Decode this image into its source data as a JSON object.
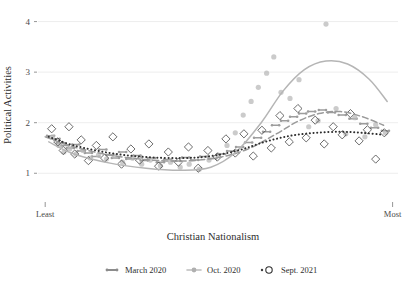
{
  "chart_data": {
    "type": "scatter",
    "title": "",
    "xlabel": "Christian Nationalism",
    "ylabel": "Political Activities",
    "xlim": [
      0,
      1
    ],
    "ylim": [
      0.55,
      4.15
    ],
    "yticks": [
      1,
      2,
      3,
      4
    ],
    "ytick_labels": [
      "1",
      "2",
      "3",
      "4"
    ],
    "xtick_labels": [
      "Least",
      "Most"
    ],
    "grid": "horizontal",
    "legend_position": "bottom-center",
    "series": [
      {
        "name": "March 2020",
        "color": "#8c8c8c",
        "marker": "dash",
        "line_style": "dashed",
        "points": [
          [
            0.035,
            1.74
          ],
          [
            0.05,
            1.68
          ],
          [
            0.062,
            1.6
          ],
          [
            0.075,
            1.55
          ],
          [
            0.09,
            1.5
          ],
          [
            0.105,
            1.57
          ],
          [
            0.12,
            1.44
          ],
          [
            0.14,
            1.4
          ],
          [
            0.16,
            1.33
          ],
          [
            0.18,
            1.47
          ],
          [
            0.2,
            1.36
          ],
          [
            0.215,
            1.3
          ],
          [
            0.235,
            1.42
          ],
          [
            0.255,
            1.28
          ],
          [
            0.275,
            1.35
          ],
          [
            0.295,
            1.25
          ],
          [
            0.315,
            1.3
          ],
          [
            0.34,
            1.22
          ],
          [
            0.36,
            1.27
          ],
          [
            0.385,
            1.24
          ],
          [
            0.41,
            1.31
          ],
          [
            0.435,
            1.26
          ],
          [
            0.46,
            1.33
          ],
          [
            0.485,
            1.29
          ],
          [
            0.51,
            1.38
          ],
          [
            0.535,
            1.44
          ],
          [
            0.56,
            1.52
          ],
          [
            0.585,
            1.61
          ],
          [
            0.61,
            1.7
          ],
          [
            0.635,
            1.82
          ],
          [
            0.66,
            1.95
          ],
          [
            0.685,
            2.04
          ],
          [
            0.71,
            2.12
          ],
          [
            0.735,
            2.18
          ],
          [
            0.76,
            2.22
          ],
          [
            0.79,
            2.25
          ],
          [
            0.815,
            2.2
          ],
          [
            0.845,
            2.15
          ],
          [
            0.875,
            2.08
          ],
          [
            0.905,
            1.98
          ],
          [
            0.935,
            1.9
          ],
          [
            0.965,
            1.84
          ]
        ],
        "fit": [
          [
            0.02,
            1.72
          ],
          [
            0.1,
            1.52
          ],
          [
            0.2,
            1.36
          ],
          [
            0.3,
            1.27
          ],
          [
            0.4,
            1.24
          ],
          [
            0.5,
            1.31
          ],
          [
            0.58,
            1.47
          ],
          [
            0.66,
            1.77
          ],
          [
            0.72,
            2.02
          ],
          [
            0.78,
            2.18
          ],
          [
            0.84,
            2.22
          ],
          [
            0.9,
            2.12
          ],
          [
            0.96,
            1.95
          ]
        ]
      },
      {
        "name": "Oct. 2020",
        "color": "#b9b9b9",
        "marker": "circle-filled",
        "line_style": "solid",
        "points": [
          [
            0.04,
            1.72
          ],
          [
            0.058,
            1.55
          ],
          [
            0.072,
            1.42
          ],
          [
            0.088,
            1.48
          ],
          [
            0.105,
            1.38
          ],
          [
            0.125,
            1.45
          ],
          [
            0.145,
            1.3
          ],
          [
            0.168,
            1.36
          ],
          [
            0.19,
            1.28
          ],
          [
            0.212,
            1.34
          ],
          [
            0.235,
            1.22
          ],
          [
            0.262,
            1.3
          ],
          [
            0.288,
            1.18
          ],
          [
            0.312,
            1.26
          ],
          [
            0.34,
            1.15
          ],
          [
            0.368,
            1.22
          ],
          [
            0.395,
            1.12
          ],
          [
            0.42,
            1.18
          ],
          [
            0.448,
            1.08
          ],
          [
            0.475,
            1.26
          ],
          [
            0.5,
            1.36
          ],
          [
            0.525,
            1.55
          ],
          [
            0.548,
            1.8
          ],
          [
            0.57,
            2.15
          ],
          [
            0.592,
            2.42
          ],
          [
            0.612,
            2.7
          ],
          [
            0.635,
            2.98
          ],
          [
            0.655,
            3.3
          ],
          [
            0.675,
            2.6
          ],
          [
            0.7,
            2.48
          ],
          [
            0.725,
            2.85
          ],
          [
            0.752,
            1.92
          ],
          [
            0.778,
            2.04
          ],
          [
            0.8,
            3.95
          ],
          [
            0.828,
            2.28
          ],
          [
            0.855,
            1.78
          ],
          [
            0.88,
            2.1
          ],
          [
            0.908,
            1.72
          ],
          [
            0.938,
            1.96
          ],
          [
            0.965,
            1.8
          ]
        ],
        "fit": [
          [
            0.03,
            1.62
          ],
          [
            0.1,
            1.38
          ],
          [
            0.2,
            1.2
          ],
          [
            0.3,
            1.1
          ],
          [
            0.4,
            1.06
          ],
          [
            0.48,
            1.12
          ],
          [
            0.55,
            1.42
          ],
          [
            0.62,
            2.0
          ],
          [
            0.68,
            2.62
          ],
          [
            0.74,
            3.05
          ],
          [
            0.8,
            3.22
          ],
          [
            0.86,
            3.16
          ],
          [
            0.92,
            2.86
          ],
          [
            0.97,
            2.42
          ]
        ]
      },
      {
        "name": "Sept. 2021",
        "color": "#3d3d3d",
        "marker": "diamond-open",
        "line_style": "dotted",
        "points": [
          [
            0.038,
            1.88
          ],
          [
            0.055,
            1.62
          ],
          [
            0.07,
            1.45
          ],
          [
            0.086,
            1.92
          ],
          [
            0.102,
            1.38
          ],
          [
            0.12,
            1.66
          ],
          [
            0.14,
            1.25
          ],
          [
            0.162,
            1.55
          ],
          [
            0.185,
            1.3
          ],
          [
            0.208,
            1.72
          ],
          [
            0.232,
            1.18
          ],
          [
            0.258,
            1.48
          ],
          [
            0.282,
            1.26
          ],
          [
            0.308,
            1.58
          ],
          [
            0.335,
            1.14
          ],
          [
            0.362,
            1.42
          ],
          [
            0.39,
            1.22
          ],
          [
            0.418,
            1.52
          ],
          [
            0.445,
            1.1
          ],
          [
            0.472,
            1.45
          ],
          [
            0.498,
            1.32
          ],
          [
            0.522,
            1.68
          ],
          [
            0.548,
            1.4
          ],
          [
            0.572,
            1.78
          ],
          [
            0.598,
            1.34
          ],
          [
            0.622,
            1.85
          ],
          [
            0.648,
            1.5
          ],
          [
            0.672,
            2.14
          ],
          [
            0.698,
            1.62
          ],
          [
            0.722,
            2.28
          ],
          [
            0.745,
            1.7
          ],
          [
            0.77,
            2.05
          ],
          [
            0.795,
            1.58
          ],
          [
            0.82,
            1.92
          ],
          [
            0.845,
            1.76
          ],
          [
            0.868,
            2.18
          ],
          [
            0.892,
            1.64
          ],
          [
            0.915,
            1.86
          ],
          [
            0.938,
            1.28
          ],
          [
            0.962,
            1.8
          ]
        ],
        "fit": [
          [
            0.03,
            1.72
          ],
          [
            0.1,
            1.55
          ],
          [
            0.2,
            1.4
          ],
          [
            0.3,
            1.32
          ],
          [
            0.4,
            1.3
          ],
          [
            0.48,
            1.34
          ],
          [
            0.56,
            1.46
          ],
          [
            0.63,
            1.62
          ],
          [
            0.7,
            1.74
          ],
          [
            0.77,
            1.8
          ],
          [
            0.84,
            1.82
          ],
          [
            0.9,
            1.8
          ],
          [
            0.96,
            1.76
          ]
        ]
      }
    ]
  },
  "legend": {
    "items": [
      {
        "label": "March 2020",
        "marker": "dash-dark",
        "color": "#8c8c8c"
      },
      {
        "label": "Oct. 2020",
        "marker": "circle-gray",
        "color": "#b9b9b9"
      },
      {
        "label": "Sept. 2021",
        "marker": "diamond-open",
        "color": "#3d3d3d"
      }
    ]
  }
}
